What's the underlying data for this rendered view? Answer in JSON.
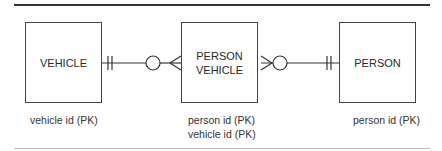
{
  "diagram": {
    "type": "entity-relationship",
    "entities": [
      {
        "name_lines": [
          "VEHICLE"
        ],
        "attributes": [
          "vehicle id (PK)"
        ]
      },
      {
        "name_lines": [
          "PERSON",
          "VEHICLE"
        ],
        "attributes": [
          "person id (PK)",
          "vehicle id (PK)"
        ]
      },
      {
        "name_lines": [
          "PERSON"
        ],
        "attributes": [
          "person id (PK)"
        ]
      }
    ],
    "relationships": [
      {
        "from": "VEHICLE",
        "to": "PERSON VEHICLE",
        "from_cardinality": "one-and-only-one",
        "to_cardinality": "zero-or-many"
      },
      {
        "from": "PERSON",
        "to": "PERSON VEHICLE",
        "from_cardinality": "one-and-only-one",
        "to_cardinality": "zero-or-many"
      }
    ]
  }
}
